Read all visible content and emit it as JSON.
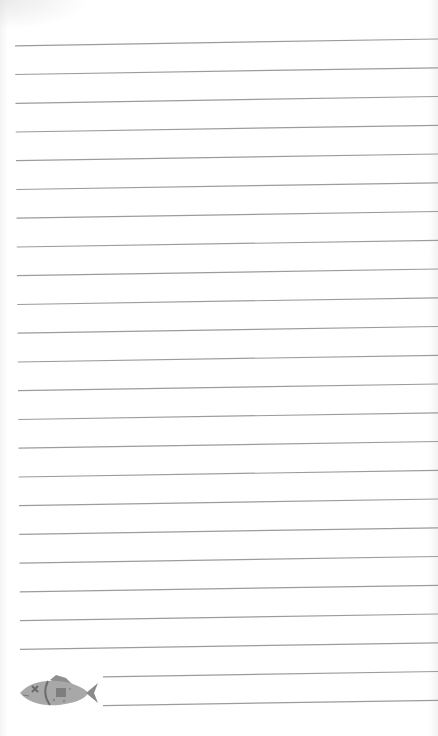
{
  "paper": {
    "background": "#ffffff",
    "line_color": "#9c9c9c",
    "line_count_full": 22,
    "line_count_short": 2,
    "first_line_left_y": 46,
    "first_line_right_y": 39,
    "line_spacing": 28.75,
    "full_line_x_start": 15,
    "short_line_x_start": 103,
    "line_x_end": 438
  },
  "decoration": {
    "icon": "fish-icon",
    "fish_color": "#a8a8a8",
    "fish_detail_color": "#7a7a7a"
  }
}
